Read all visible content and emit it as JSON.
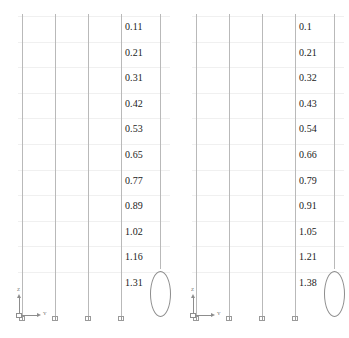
{
  "view": {
    "title": "Structural Column Model Deflection View",
    "axis_triad": {
      "vertical_axis_label": "Z",
      "horizontal_axis_label": "Y",
      "icon": "axis-triad-icon"
    },
    "column_count_per_group": 5,
    "support_icon": "fixed-base-support-icon",
    "ellipse_icon": "ellipse-member-icon",
    "gridline_color": "#f0f0f0",
    "member_color": "#b9b9b9",
    "text_color": "#1a1a1a"
  },
  "groups": [
    {
      "name": "left-model",
      "labels": [
        "0.11",
        "0.21",
        "0.31",
        "0.42",
        "0.53",
        "0.65",
        "0.77",
        "0.89",
        "1.02",
        "1.16",
        "1.31"
      ]
    },
    {
      "name": "right-model",
      "labels": [
        "0.1",
        "0.21",
        "0.32",
        "0.43",
        "0.54",
        "0.66",
        "0.79",
        "0.91",
        "1.05",
        "1.21",
        "1.38"
      ]
    }
  ],
  "chart_data": {
    "type": "line",
    "xlabel": "Y",
    "ylabel": "Z",
    "grid": true,
    "legend": "none",
    "series": [
      {
        "name": "left-model",
        "categories": [
          "1",
          "2",
          "3",
          "4",
          "5",
          "6",
          "7",
          "8",
          "9",
          "10",
          "11"
        ],
        "values": [
          0.11,
          0.21,
          0.31,
          0.42,
          0.53,
          0.65,
          0.77,
          0.89,
          1.02,
          1.16,
          1.31
        ]
      },
      {
        "name": "right-model",
        "categories": [
          "1",
          "2",
          "3",
          "4",
          "5",
          "6",
          "7",
          "8",
          "9",
          "10",
          "11"
        ],
        "values": [
          0.1,
          0.21,
          0.32,
          0.43,
          0.54,
          0.66,
          0.79,
          0.91,
          1.05,
          1.21,
          1.38
        ]
      }
    ],
    "ylim": [
      0,
      1.4
    ]
  }
}
